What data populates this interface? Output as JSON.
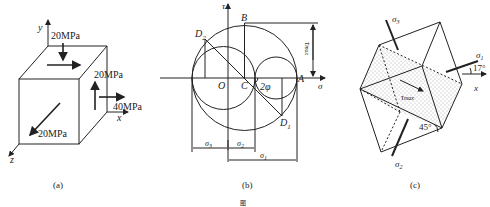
{
  "figure_a": {
    "caption": "(a)",
    "axes": {
      "x": "x",
      "y": "y",
      "z": "z"
    },
    "stresses": {
      "top_face": "20MPa",
      "right_face_shear": "20MPa",
      "right_face_normal": "40MPa",
      "front_face": "20MPa"
    }
  },
  "figure_b": {
    "caption": "(b)",
    "axes": {
      "tau": "τ",
      "sigma": "σ"
    },
    "points": {
      "B": "B",
      "D2": "D",
      "D2_sub": "2",
      "A": "A",
      "O": "O",
      "C": "C",
      "D1": "D",
      "D1_sub": "1"
    },
    "angle_label": "2φ",
    "tau_max_label": "τ",
    "tau_max_sub": "max",
    "dimensions": {
      "s3": "σ",
      "s3_sub": "3",
      "s2": "σ",
      "s2_sub": "2",
      "s1": "σ",
      "s1_sub": "1"
    }
  },
  "figure_c": {
    "caption": "(c)",
    "sigma1": "σ",
    "sigma1_sub": "1",
    "sigma2": "σ",
    "sigma2_sub": "2",
    "sigma3": "σ",
    "sigma3_sub": "3",
    "tau_max": "τ",
    "tau_max_sub": "max",
    "angle_17": "17°",
    "angle_45": "45°",
    "x_axis": "x"
  },
  "footer_mark": "图"
}
